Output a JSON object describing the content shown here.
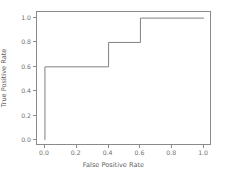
{
  "chart_data": {
    "type": "line",
    "title": "",
    "xlabel": "False Positive Rate",
    "ylabel": "True Positive Rate",
    "xlim": [
      -0.05,
      1.05
    ],
    "ylim": [
      -0.05,
      1.05
    ],
    "xticks": [
      "0.0",
      "0.2",
      "0.4",
      "0.6",
      "0.8",
      "1.0"
    ],
    "xtick_values": [
      0.0,
      0.2,
      0.4,
      0.6,
      0.8,
      1.0
    ],
    "yticks": [
      "0.0",
      "0.2",
      "0.4",
      "0.6",
      "0.8",
      "1.0"
    ],
    "ytick_values": [
      0.0,
      0.2,
      0.4,
      0.6,
      0.8,
      1.0
    ],
    "grid": false,
    "legend": false,
    "drawstyle": "steps-post",
    "series": [
      {
        "name": "ROC curve",
        "color": "#808080",
        "linewidth": 1,
        "x": [
          0.0,
          0.0,
          0.4,
          0.4,
          0.6,
          0.6,
          1.0
        ],
        "y": [
          0.0,
          0.6,
          0.6,
          0.8,
          0.8,
          1.0,
          1.0
        ]
      }
    ]
  },
  "figure": {
    "background": "#ffffff",
    "axes_edge_color": "#8a8a8a",
    "tick_color": "#6e6e6e",
    "label_color": "#5f5f5f"
  }
}
